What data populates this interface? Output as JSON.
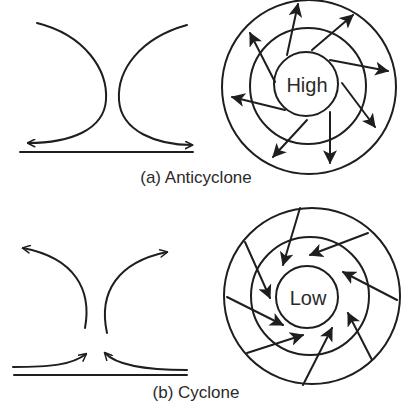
{
  "panels": [
    {
      "id": "anticyclone",
      "caption": "(a) Anticyclone",
      "center_label": "High",
      "flow": "outward",
      "side_view": "descending air diverging at surface",
      "arrow_count": 8
    },
    {
      "id": "cyclone",
      "caption": "(b) Cyclone",
      "center_label": "Low",
      "flow": "inward",
      "side_view": "surface air converging and rising",
      "arrow_count": 8
    }
  ],
  "colors": {
    "line": "#1e1e1e",
    "text": "#2a2a2a",
    "background": "#ffffff"
  }
}
